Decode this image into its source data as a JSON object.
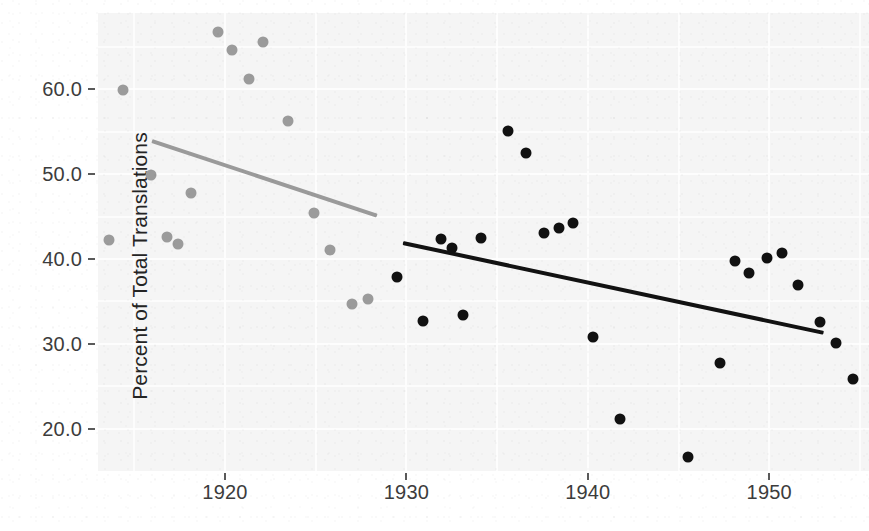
{
  "chart_data": {
    "type": "scatter",
    "title": "",
    "xlabel": "",
    "ylabel": "Percent of Total Translations",
    "xlim": [
      1913,
      1955.5
    ],
    "ylim": [
      15.0,
      69.0
    ],
    "grid": true,
    "legend": "none",
    "xticks": [
      1920,
      1930,
      1940,
      1950
    ],
    "xtick_labels": [
      "1920",
      "1930",
      "1940",
      "1950"
    ],
    "yticks": [
      20.0,
      30.0,
      40.0,
      50.0,
      60.0
    ],
    "ytick_labels": [
      "20.0",
      "30.0",
      "40.0",
      "50.0",
      "60.0"
    ],
    "series": [
      {
        "name": "Early period (pre-1930)",
        "color": "#9b9b9b",
        "marker": "circle",
        "points": [
          {
            "x": 1913.6,
            "y": 42.2
          },
          {
            "x": 1914.4,
            "y": 59.9
          },
          {
            "x": 1915.9,
            "y": 49.9
          },
          {
            "x": 1916.8,
            "y": 42.6
          },
          {
            "x": 1917.4,
            "y": 41.8
          },
          {
            "x": 1918.1,
            "y": 47.8
          },
          {
            "x": 1919.6,
            "y": 66.8
          },
          {
            "x": 1920.4,
            "y": 64.6
          },
          {
            "x": 1921.3,
            "y": 61.2
          },
          {
            "x": 1922.1,
            "y": 65.6
          },
          {
            "x": 1923.5,
            "y": 56.3
          },
          {
            "x": 1924.9,
            "y": 45.4
          },
          {
            "x": 1925.8,
            "y": 41.1
          },
          {
            "x": 1927.0,
            "y": 34.7
          },
          {
            "x": 1927.9,
            "y": 35.3
          }
        ],
        "trendline": {
          "x_start": 1916.0,
          "y_start": 54.2,
          "x_end": 1928.4,
          "y_end": 45.4
        }
      },
      {
        "name": "Late period (1930 onward)",
        "color": "#111111",
        "marker": "circle",
        "points": [
          {
            "x": 1929.5,
            "y": 37.9
          },
          {
            "x": 1930.9,
            "y": 32.7
          },
          {
            "x": 1931.9,
            "y": 42.3
          },
          {
            "x": 1932.5,
            "y": 41.3
          },
          {
            "x": 1933.1,
            "y": 33.4
          },
          {
            "x": 1934.1,
            "y": 42.5
          },
          {
            "x": 1935.6,
            "y": 55.1
          },
          {
            "x": 1936.6,
            "y": 52.5
          },
          {
            "x": 1937.6,
            "y": 43.1
          },
          {
            "x": 1938.4,
            "y": 43.7
          },
          {
            "x": 1939.2,
            "y": 44.2
          },
          {
            "x": 1940.3,
            "y": 30.8
          },
          {
            "x": 1941.8,
            "y": 21.1
          },
          {
            "x": 1945.5,
            "y": 16.6
          },
          {
            "x": 1947.3,
            "y": 27.7
          },
          {
            "x": 1948.1,
            "y": 39.8
          },
          {
            "x": 1948.9,
            "y": 38.3
          },
          {
            "x": 1949.9,
            "y": 40.1
          },
          {
            "x": 1950.7,
            "y": 40.7
          },
          {
            "x": 1951.6,
            "y": 36.9
          },
          {
            "x": 1952.8,
            "y": 32.6
          },
          {
            "x": 1953.7,
            "y": 30.1
          },
          {
            "x": 1954.6,
            "y": 25.9
          }
        ],
        "trendline": {
          "x_start": 1929.8,
          "y_start": 42.1,
          "x_end": 1953.0,
          "y_end": 31.5
        }
      }
    ]
  }
}
